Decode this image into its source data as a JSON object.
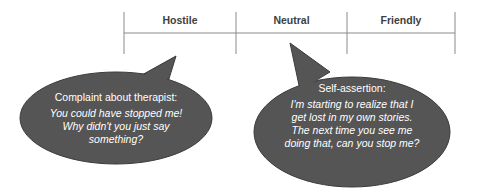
{
  "scale": {
    "columns": [
      {
        "label": "Hostile"
      },
      {
        "label": "Neutral"
      },
      {
        "label": "Friendly"
      }
    ]
  },
  "bubbles": [
    {
      "title": "Complaint about therapist:",
      "quote_lines": [
        "You could have stopped me!",
        "Why didn't you just say",
        "something?"
      ]
    },
    {
      "title": "Self-assertion:",
      "quote_lines": [
        "I'm starting to realize that I",
        "get lost in my own stories.",
        "The next time you see me",
        "doing that, can you stop me?"
      ]
    }
  ],
  "colors": {
    "bubble_fill": "#555555",
    "line": "#8a8a8a",
    "text_dark": "#404040"
  }
}
